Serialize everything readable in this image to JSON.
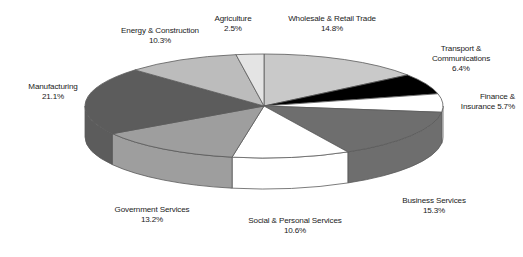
{
  "chart_data": {
    "type": "pie",
    "title": "",
    "three_d": true,
    "legend": "none",
    "labels_position": "outside",
    "categories": [
      "Wholesale & Retail Trade",
      "Transport & Communications",
      "Finance & Insurance",
      "Business Services",
      "Social & Personal Services",
      "Government Services",
      "Manufacturing",
      "Energy & Construction",
      "Agriculture"
    ],
    "values": [
      14.8,
      6.4,
      5.7,
      15.3,
      10.6,
      13.2,
      21.1,
      10.3,
      2.5
    ],
    "unit": "%",
    "colors": [
      "#c9c9c9",
      "#000000",
      "#ffffff",
      "#6e6e6e",
      "#ffffff",
      "#9e9e9e",
      "#5c5c5c",
      "#bcbcbc",
      "#e4e4e4"
    ],
    "slices": [
      {
        "name": "Wholesale & Retail Trade",
        "value": 14.8,
        "label_pct": "14.8%",
        "color": "#c9c9c9"
      },
      {
        "name": "Transport & Communications",
        "value": 6.4,
        "label_pct": "6.4%",
        "color": "#000000"
      },
      {
        "name": "Finance & Insurance",
        "value": 5.7,
        "label_pct": "5.7%",
        "color": "#ffffff"
      },
      {
        "name": "Business Services",
        "value": 15.3,
        "label_pct": "15.3%",
        "color": "#6e6e6e"
      },
      {
        "name": "Social & Personal Services",
        "value": 10.6,
        "label_pct": "10.6%",
        "color": "#ffffff"
      },
      {
        "name": "Government Services",
        "value": 13.2,
        "label_pct": "13.2%",
        "color": "#9e9e9e"
      },
      {
        "name": "Manufacturing",
        "value": 21.1,
        "label_pct": "21.1%",
        "color": "#5c5c5c"
      },
      {
        "name": "Energy & Construction",
        "value": 10.3,
        "label_pct": "10.3%",
        "color": "#bcbcbc"
      },
      {
        "name": "Agriculture",
        "value": 2.5,
        "label_pct": "2.5%",
        "color": "#e4e4e4"
      }
    ],
    "xlabel": "",
    "ylabel": ""
  },
  "labels": {
    "agriculture": {
      "name": "Agriculture",
      "pct": "2.5%"
    },
    "wholesale": {
      "name": "Wholesale & Retail Trade",
      "pct": "14.8%"
    },
    "energy": {
      "name": "Energy & Construction",
      "pct": "10.3%"
    },
    "transport": {
      "name_line1": "Transport &",
      "name_line2": "Communications",
      "pct": "6.4%"
    },
    "manufacturing": {
      "name": "Manufacturing",
      "pct": "21.1%"
    },
    "finance": {
      "name_line1": "Finance &",
      "name_line2": "Insurance 5.7%"
    },
    "business": {
      "name": "Business Services",
      "pct": "15.3%"
    },
    "social": {
      "name": "Social & Personal Services",
      "pct": "10.6%"
    },
    "government": {
      "name": "Government Services",
      "pct": "13.2%"
    }
  },
  "style": {
    "background": "#ffffff",
    "outline": "#5a5a5a",
    "text": "#1b1b1b"
  }
}
